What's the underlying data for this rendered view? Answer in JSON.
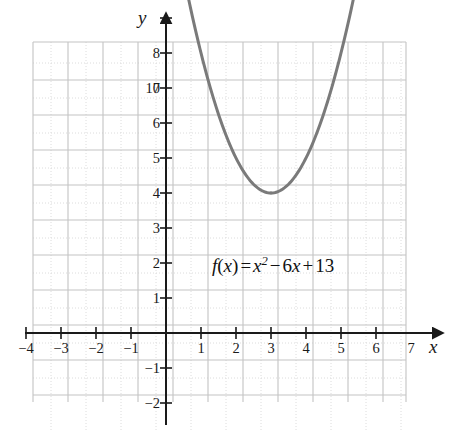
{
  "figure": {
    "background_color": "#ffffff",
    "width": 463,
    "height": 430
  },
  "axes": {
    "x_axis_label": "x",
    "y_axis_label": "y",
    "axis_color": "#1a1a1a",
    "origin_px": {
      "x": 166,
      "y": 333
    },
    "unit_px": 35,
    "x_tick_labels": [
      "−4",
      "−3",
      "−2",
      "−1",
      "1",
      "2",
      "3",
      "4",
      "5",
      "6",
      "7",
      "8"
    ],
    "x_tick_values": [
      -4,
      -3,
      -2,
      -1,
      1,
      2,
      3,
      4,
      5,
      6,
      7,
      8
    ],
    "y_tick_labels": [
      "−2",
      "−1",
      "1",
      "2",
      "3",
      "4",
      "5",
      "6",
      "7",
      "8",
      "9",
      "10"
    ],
    "y_tick_values": [
      -2,
      -1,
      1,
      2,
      3,
      4,
      5,
      6,
      7,
      8,
      9,
      10
    ]
  },
  "grid": {
    "major_color": "#c3c3c3",
    "minor_color": "#dcdcdc",
    "minor_per_unit": 2,
    "x_min": -4.8,
    "x_max": 8.9,
    "y_min": -2.8,
    "y_max": 11.7
  },
  "annotation": {
    "equation_parts": {
      "f": "f",
      "open_paren": "(",
      "x_arg": "x",
      "close_paren": ")",
      "equals": "=",
      "x_term": "x",
      "exponent": "2",
      "minus": "−",
      "coefficient": "6",
      "linear_var": "x",
      "plus": "+",
      "constant": "13"
    },
    "equation_text": "f(x) = x² − 6x + 13"
  },
  "chart_data": {
    "type": "line",
    "title": "",
    "xlabel": "x",
    "ylabel": "y",
    "xlim": [
      -4.8,
      8.9
    ],
    "ylim": [
      -2.8,
      11.7
    ],
    "grid": true,
    "legend": "none",
    "curve_color": "#7a7a7a",
    "curve_width_px": 3,
    "function": "f(x) = x^2 - 6x + 13",
    "coefficients": {
      "a": 1,
      "b": -6,
      "c": 13
    },
    "vertex": [
      3,
      4
    ],
    "axis_of_symmetry": 3,
    "domain_drawn": [
      0.4,
      5.6
    ],
    "arrowheads": [
      "start",
      "end"
    ],
    "series": [
      {
        "name": "f(x) = x² − 6x + 13",
        "x": [
          0.4,
          0.8,
          1.2,
          1.6,
          2.0,
          2.4,
          2.8,
          3.0,
          3.2,
          3.6,
          4.0,
          4.4,
          4.8,
          5.2,
          5.6
        ],
        "values": [
          10.76,
          8.84,
          7.24,
          5.96,
          5.0,
          4.36,
          4.04,
          4.0,
          4.04,
          4.36,
          5.0,
          5.96,
          7.24,
          8.84,
          10.76
        ]
      }
    ],
    "labeled_points": [
      {
        "x": 3,
        "y": 4,
        "label": "vertex"
      }
    ]
  }
}
